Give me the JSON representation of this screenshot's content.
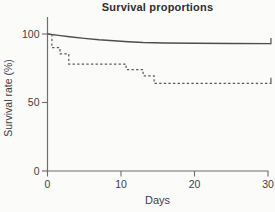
{
  "chart_data": {
    "type": "line",
    "title": "Survival proportions",
    "xlabel": "Days",
    "ylabel": "Survival rate (%)",
    "xlim": [
      0,
      30
    ],
    "ylim": [
      0,
      100
    ],
    "xticks": [
      0,
      10,
      20,
      30
    ],
    "yticks": [
      0,
      50,
      100
    ],
    "grid": false,
    "legend_position": "none",
    "axis_color": "#6e6e6e",
    "series": [
      {
        "name": "group-1-solid",
        "line_style": "solid",
        "color": "#4d4d4d",
        "step": false,
        "end_censor_tick": true,
        "points": [
          [
            0,
            100
          ],
          [
            1.5,
            99
          ],
          [
            3,
            98
          ],
          [
            5,
            96.8
          ],
          [
            7,
            95.8
          ],
          [
            9,
            95
          ],
          [
            11,
            94.3
          ],
          [
            13,
            93.8
          ],
          [
            16,
            93.4
          ],
          [
            20,
            93.2
          ],
          [
            25,
            93.1
          ],
          [
            30.4,
            93
          ]
        ]
      },
      {
        "name": "group-2-dashed",
        "line_style": "dashed",
        "color": "#585858",
        "step": true,
        "end_censor_tick": true,
        "points": [
          [
            0,
            100
          ],
          [
            0.6,
            100
          ],
          [
            0.6,
            90
          ],
          [
            1.7,
            90
          ],
          [
            1.7,
            85.5
          ],
          [
            2.9,
            85.5
          ],
          [
            2.9,
            78
          ],
          [
            10.7,
            78
          ],
          [
            10.7,
            74
          ],
          [
            13,
            74
          ],
          [
            13,
            69.5
          ],
          [
            14.5,
            69.5
          ],
          [
            14.5,
            64
          ],
          [
            30.4,
            64
          ]
        ]
      }
    ]
  }
}
